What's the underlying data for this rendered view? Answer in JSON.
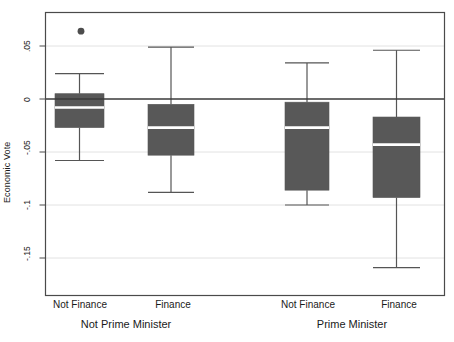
{
  "chart_data": {
    "type": "box",
    "title": "",
    "xlabel": "",
    "ylabel": "Economic Vote",
    "ylim": [
      -0.175,
      0.078
    ],
    "yticks": [
      0.05,
      0,
      -0.05,
      -0.1,
      -0.15
    ],
    "ytick_labels": [
      ".05",
      "0",
      "-.05",
      "-.1",
      "-.15"
    ],
    "grid": "horizontal",
    "legend": "none",
    "zero_line": 0,
    "group_labels": [
      "Not Prime Minister",
      "Prime Minister"
    ],
    "categories": [
      "Not Finance",
      "Finance",
      "Not Finance",
      "Finance"
    ],
    "boxes": [
      {
        "label": "Not Finance",
        "group": "Not Prime Minister",
        "whisker_high": 0.024,
        "q3": 0.005,
        "median": -0.008,
        "q1": -0.027,
        "whisker_low": -0.058,
        "outliers": [
          0.064
        ]
      },
      {
        "label": "Finance",
        "group": "Not Prime Minister",
        "whisker_high": 0.049,
        "q3": -0.005,
        "median": -0.027,
        "q1": -0.053,
        "whisker_low": -0.088,
        "outliers": []
      },
      {
        "label": "Not Finance",
        "group": "Prime Minister",
        "whisker_high": 0.034,
        "q3": -0.003,
        "median": -0.027,
        "q1": -0.086,
        "whisker_low": -0.1,
        "outliers": []
      },
      {
        "label": "Finance",
        "group": "Prime Minister",
        "whisker_high": 0.046,
        "q3": -0.017,
        "median": -0.043,
        "q1": -0.093,
        "whisker_low": -0.159,
        "outliers": []
      }
    ],
    "colors": {
      "box_fill": "#585858",
      "box_edge": "#585858",
      "median": "#ffffff",
      "whisker": "#555555",
      "outlier": "#4d4d4d",
      "gridline": "#e2e2e2",
      "zero_line": "#3a3a3a",
      "frame": "#4a4a4a",
      "background": "#ffffff",
      "text": "#1a1a1a"
    }
  }
}
